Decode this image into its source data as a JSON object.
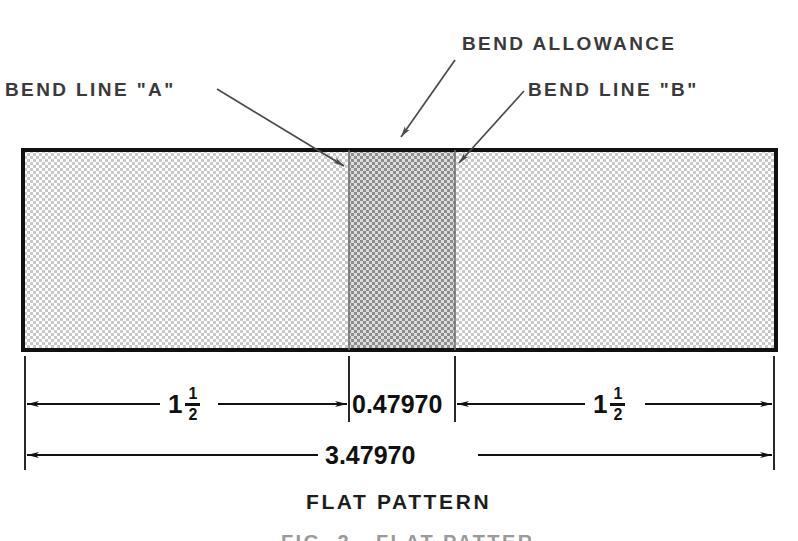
{
  "diagram": {
    "title": "FLAT PATTERN",
    "partial_caption": "FIG. 2 - FLAT PATTERN",
    "annotations": {
      "bend_line_a": "BEND LINE \"A\"",
      "bend_allowance": "BEND ALLOWANCE",
      "bend_line_b": "BEND LINE \"B\""
    },
    "dimensions": {
      "left_flange_whole": "1",
      "left_flange_numerator": "1",
      "left_flange_denominator": "2",
      "bend_allowance_value": "0.47970",
      "right_flange_whole": "1",
      "right_flange_numerator": "1",
      "right_flange_denominator": "2",
      "overall_length": "3.47970"
    },
    "colors": {
      "outline": "#111111",
      "flange_fill": "#d8d8d8",
      "bend_fill": "#a8a8a8",
      "leader": "#4a4a4a",
      "dimension": "#111111",
      "label_text": "#3a3a3a",
      "background": "#ffffff"
    }
  }
}
